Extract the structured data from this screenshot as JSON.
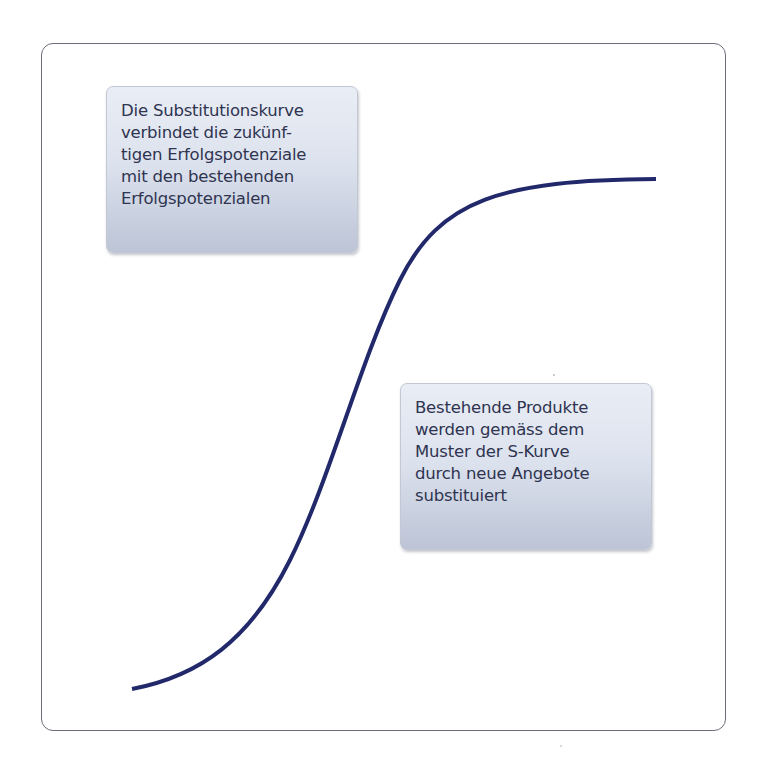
{
  "diagram": {
    "type": "s-curve",
    "frame": {
      "border_color": "#6b6e7a",
      "corner_radius": 12
    },
    "curve": {
      "color": "#22296b",
      "description": "S-curve (substitution curve) rising from bottom-left to top-right",
      "start": [
        132,
        689
      ],
      "end": [
        656,
        179
      ]
    },
    "notes": [
      {
        "id": "note-1",
        "lines": [
          "Die Substitutionskurve",
          "verbindet die zukünf-",
          "tigen Erfolgspotenziale",
          "mit den bestehenden",
          "Erfolgspotenzialen"
        ]
      },
      {
        "id": "note-2",
        "lines": [
          "Bestehende Produkte",
          "werden gemäss dem",
          "Muster der S-Kurve",
          "durch neue Angebote",
          "substituiert"
        ]
      }
    ]
  }
}
